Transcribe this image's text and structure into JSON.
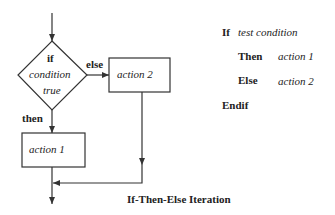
{
  "flowchart": {
    "diamond": {
      "line1": "if",
      "line2": "condition",
      "line3": "true"
    },
    "else_label": "else",
    "then_label": "then",
    "action2": "action 2",
    "action1": "action 1",
    "caption": "If-Then-Else Iteration"
  },
  "pseudocode": {
    "if_kw": "If",
    "if_text": "test condition",
    "then_kw": "Then",
    "then_text": "action 1",
    "else_kw": "Else",
    "else_text": "action 2",
    "endif_kw": "Endif"
  },
  "colors": {
    "line": "#333333",
    "text": "#222222",
    "background": "#ffffff"
  }
}
